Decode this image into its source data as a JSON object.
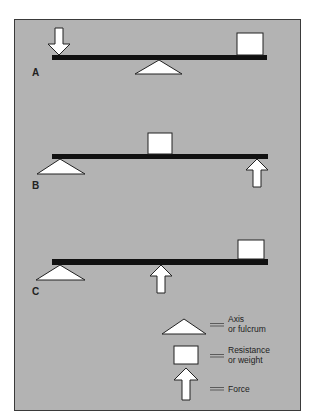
{
  "diagram": {
    "type": "lever classes",
    "colors": {
      "background": "#b3b3b3",
      "beam": "#111111",
      "shape_fill": "#ffffff",
      "outline": "#222222",
      "frame_border": "#3a3a3a"
    },
    "panels": [
      {
        "label": "A",
        "fulcrum": "middle",
        "resistance": "right end",
        "force": "left end, downward"
      },
      {
        "label": "B",
        "fulcrum": "left end",
        "resistance": "middle",
        "force": "right end, upward"
      },
      {
        "label": "C",
        "fulcrum": "left end",
        "resistance": "right end",
        "force": "middle, upward"
      }
    ],
    "legend": {
      "axis": {
        "line1": "Axis",
        "line2": "or fulcrum",
        "icon": "triangle-icon"
      },
      "resistance": {
        "line1": "Resistance",
        "line2": "or weight",
        "icon": "box-icon"
      },
      "force": {
        "line1": "Force",
        "icon": "arrow-up-icon"
      },
      "equals": "=="
    }
  }
}
